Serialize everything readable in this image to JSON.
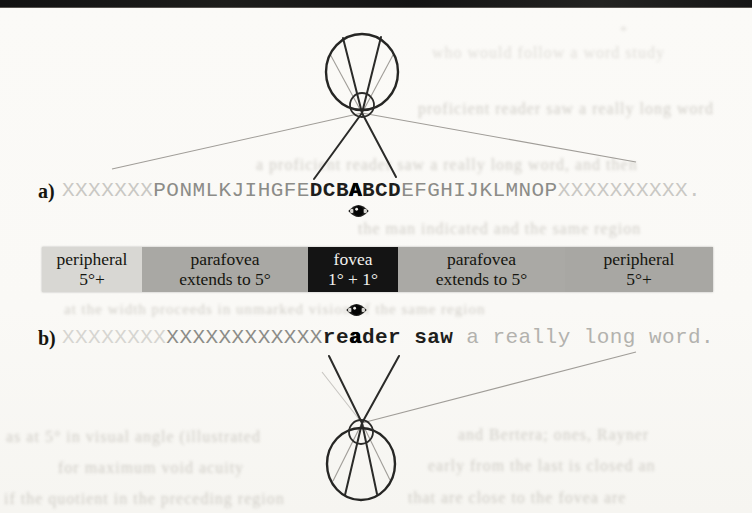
{
  "figure": {
    "panels": {
      "a_label": "a)",
      "b_label": "b)"
    },
    "line_a": {
      "peripheral_left": "XXXXXXX",
      "parafovea_left": "PONMLKJIHGFE",
      "fovea_pre": "DCB",
      "fixation": "A",
      "fovea_post": "BCD",
      "parafovea_right": "EFGHIJKLMNOP",
      "peripheral_right": "XXXXXXXXXX."
    },
    "line_b": {
      "peripheral_left": "XXXXXXXX",
      "parafovea_left": "XXXXXXXXXXXX",
      "fovea_pre": "re",
      "fixation": "a",
      "fovea_post": "der saw",
      "peripheral_right": " a really long word."
    },
    "acuity_bar": {
      "segments": [
        {
          "id": "peripheral-left",
          "line1": "peripheral",
          "line2": "5°+",
          "bg": "#d8d7d3",
          "fg": "#15150f"
        },
        {
          "id": "parafovea-left",
          "line1": "parafovea",
          "line2": "extends to 5°",
          "bg": "#a9a8a4",
          "fg": "#15150f"
        },
        {
          "id": "fovea",
          "line1": "fovea",
          "line2": "1° + 1°",
          "bg": "#141414",
          "fg": "#f2f1ed"
        },
        {
          "id": "parafovea-right",
          "line1": "parafovea",
          "line2": "extends to 5°",
          "bg": "#aaa9a5",
          "fg": "#15150f"
        },
        {
          "id": "peripheral-right",
          "line1": "peripheral",
          "line2": "5°+",
          "bg": "#a8a7a3",
          "fg": "#15150f"
        }
      ]
    },
    "colors": {
      "bold_text": "#1e1e1c",
      "medium_text": "#8c8c88",
      "light_text": "#c9c8c4",
      "trailing_text": "#b3b2ae",
      "diagram_stroke": "#262624",
      "peripheral_ray": "#a09d98",
      "top_strip": "#161616"
    }
  },
  "bleedthrough": {
    "fragments": [
      {
        "text": "*"
      },
      {
        "text": "who would follow a word study"
      },
      {
        "text": "proficient reader saw a really long word"
      },
      {
        "text": "a proficient reader saw a really long word, and then"
      },
      {
        "text": "the man indicated and the same region"
      },
      {
        "text": "at the width proceeds in unmarked vision of the same region"
      },
      {
        "text": "as at 5° in visual angle (illustrated"
      },
      {
        "text": "and Bertera; ones, Rayner"
      },
      {
        "text": "for maximum void acuity"
      },
      {
        "text": "early from the last is closed an"
      },
      {
        "text": "if the quotient in the preceding region"
      },
      {
        "text": "that are close to the fovea are"
      }
    ]
  }
}
